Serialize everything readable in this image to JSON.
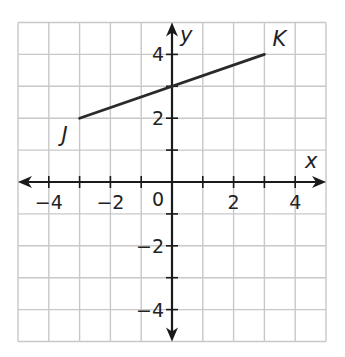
{
  "chart_data": {
    "type": "line",
    "title": "",
    "xlabel": "x",
    "ylabel": "y",
    "xlim": [
      -5,
      5
    ],
    "ylim": [
      -5,
      5
    ],
    "grid": true,
    "x_tick_labels": [
      {
        "value": -4,
        "label": "−4"
      },
      {
        "value": -2,
        "label": "−2"
      },
      {
        "value": 2,
        "label": "2"
      },
      {
        "value": 4,
        "label": "4"
      }
    ],
    "y_tick_labels": [
      {
        "value": 4,
        "label": "4"
      },
      {
        "value": 2,
        "label": "2"
      },
      {
        "value": -2,
        "label": "−2"
      },
      {
        "value": -4,
        "label": "−4"
      }
    ],
    "origin_label": "0",
    "series": [
      {
        "name": "segment JK",
        "points": [
          {
            "label": "J",
            "x": -3,
            "y": 2
          },
          {
            "label": "K",
            "x": 3,
            "y": 4
          }
        ]
      }
    ],
    "colors": {
      "grid": "#c8c8c8",
      "axis": "#1a1a1a",
      "segment": "#2a2a2a",
      "text": "#222222"
    }
  }
}
